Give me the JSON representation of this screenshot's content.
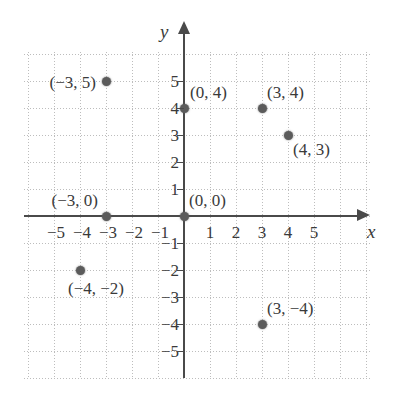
{
  "figure": {
    "type": "coordinate-plane",
    "x_axis_name": "x",
    "y_axis_name": "y"
  },
  "chart_data": {
    "type": "scatter",
    "title": "",
    "xlabel": "x",
    "ylabel": "y",
    "xlim": [
      -5.9,
      6.2
    ],
    "ylim": [
      -5.9,
      6.2
    ],
    "grid": true,
    "legend": "none",
    "x_ticks": [
      "-5",
      "-4",
      "-3",
      "-2",
      "-1",
      "1",
      "2",
      "3",
      "4",
      "5"
    ],
    "y_ticks": [
      "5",
      "4",
      "3",
      "2",
      "1",
      "-1",
      "-2",
      "-3",
      "-4",
      "-5"
    ],
    "points": [
      {
        "x": -3,
        "y": 5,
        "label": "(−3, 5)",
        "label_pos": "left"
      },
      {
        "x": 0,
        "y": 4,
        "label": "(0, 4)",
        "label_pos": "right"
      },
      {
        "x": 3,
        "y": 4,
        "label": "(3, 4)",
        "label_pos": "upper-right"
      },
      {
        "x": 4,
        "y": 3,
        "label": "(4, 3)",
        "label_pos": "lower-right"
      },
      {
        "x": -3,
        "y": 0,
        "label": "(−3, 0)",
        "label_pos": "upper-left"
      },
      {
        "x": 0,
        "y": 0,
        "label": "(0, 0)",
        "label_pos": "upper-right"
      },
      {
        "x": -4,
        "y": -2,
        "label": "(−4, −2)",
        "label_pos": "below"
      },
      {
        "x": 3,
        "y": -4,
        "label": "(3, −4)",
        "label_pos": "upper-right"
      }
    ],
    "colors": {
      "point": "#5b5b5b",
      "axis": "#4a4a4a",
      "grid": "#bdbdbd",
      "text": "#3a3a3a",
      "background": "#ffffff"
    }
  },
  "ticks": {
    "x": [
      {
        "value": "−5",
        "label": "−5"
      },
      {
        "value": "−4",
        "label": "−4"
      },
      {
        "value": "−3",
        "label": "−3"
      },
      {
        "value": "−2",
        "label": "−2"
      },
      {
        "value": "−1",
        "label": "−1"
      },
      {
        "value": "1",
        "label": "1"
      },
      {
        "value": "2",
        "label": "2"
      },
      {
        "value": "3",
        "label": "3"
      },
      {
        "value": "4",
        "label": "4"
      },
      {
        "value": "5",
        "label": "5"
      }
    ],
    "y": [
      {
        "value": "5",
        "label": "5"
      },
      {
        "value": "4",
        "label": "4"
      },
      {
        "value": "3",
        "label": "3"
      },
      {
        "value": "2",
        "label": "2"
      },
      {
        "value": "1",
        "label": "1"
      },
      {
        "value": "−1",
        "label": "−1"
      },
      {
        "value": "−2",
        "label": "−2"
      },
      {
        "value": "−3",
        "label": "−3"
      },
      {
        "value": "−4",
        "label": "−4"
      },
      {
        "value": "−5",
        "label": "−5"
      }
    ]
  }
}
